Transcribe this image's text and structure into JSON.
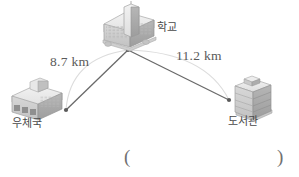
{
  "figure": {
    "type": "distance-diagram",
    "background_color": "#ffffff",
    "line_color": "#5a5a5a",
    "arc_color": "#d5d5d5",
    "text_color": "#5a5a5a"
  },
  "nodes": [
    {
      "id": "school",
      "label": "학교",
      "icon": "school-building-icon",
      "x": 128,
      "y": 50
    },
    {
      "id": "post_office",
      "label": "우체국",
      "icon": "post-office-building-icon",
      "x": 66,
      "y": 110
    },
    {
      "id": "library",
      "label": "도서관",
      "icon": "library-building-icon",
      "x": 229,
      "y": 100
    }
  ],
  "edges": [
    {
      "id": "school-post_office",
      "from": "school",
      "to": "post_office",
      "distance": "8.7 km",
      "value": 8.7,
      "unit": "km"
    },
    {
      "id": "school-library",
      "from": "school",
      "to": "library",
      "distance": "11.2 km",
      "value": 11.2,
      "unit": "km"
    }
  ],
  "answer_field": {
    "open_paren": "(",
    "close_paren": ")",
    "value": ""
  }
}
